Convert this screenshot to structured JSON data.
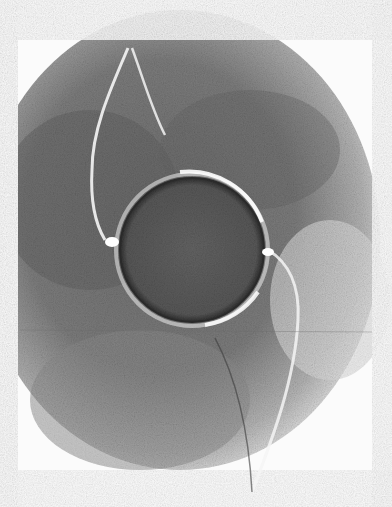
{
  "image": {
    "kind": "grayscale micrograph",
    "width": 392,
    "height": 507,
    "background": "#fbfbfb",
    "colors": {
      "field_dark": "#6a6a6a",
      "field_mid": "#9a9a9a",
      "field_light": "#e6e6e6",
      "sphere_fill": "#5e5e5e",
      "sphere_rim": "#2e2e2e",
      "highlight": "#ffffff"
    },
    "sphere": {
      "cx": 192,
      "cy": 250,
      "r": 72
    }
  }
}
